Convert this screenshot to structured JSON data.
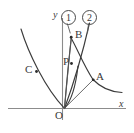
{
  "figure": {
    "type": "geometry-diagram",
    "background_color": "#ffffff",
    "axes": {
      "x_label": "x",
      "y_label": "y",
      "origin_label": "O",
      "axis_color": "#8c8c8c"
    },
    "curve_tags": [
      {
        "id": "tag-1",
        "label": "1"
      },
      {
        "id": "tag-2",
        "label": "2"
      }
    ],
    "points": [
      {
        "id": "point-a",
        "label": "A"
      },
      {
        "id": "point-b",
        "label": "B"
      },
      {
        "id": "point-c",
        "label": "C"
      },
      {
        "id": "point-p",
        "label": "P"
      },
      {
        "id": "point-o",
        "label": "O"
      }
    ],
    "curve_color": "#3b3b3b",
    "ray_color": "#5a5a5a"
  }
}
